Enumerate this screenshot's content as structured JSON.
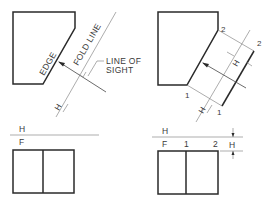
{
  "figure": {
    "panels": [
      {
        "id": "top-left",
        "description": "Top view with edge and fold line",
        "labels": {
          "edge": "EDGE",
          "fold_line": "FOLD LINE",
          "line_of_sight_1": "LINE OF",
          "line_of_sight_2": "SIGHT",
          "h": "H",
          "one": "1"
        }
      },
      {
        "id": "top-right",
        "description": "Top view with auxiliary projection",
        "labels": {
          "point_2_a": "2",
          "point_2_b": "2",
          "point_1_a": "1",
          "point_1_b": "1",
          "h": "H",
          "h_lower": "H"
        }
      },
      {
        "id": "bottom-left",
        "description": "Front view",
        "labels": {
          "h": "H",
          "f": "F"
        }
      },
      {
        "id": "bottom-right",
        "description": "Front view with reference points",
        "labels": {
          "h": "H",
          "f": "F",
          "one": "1",
          "two": "2",
          "h_dim": "H"
        }
      }
    ],
    "colors": {
      "object_line": "#2a2a2a",
      "construction_line": "#8a8a8a",
      "text": "#3a3a3a",
      "background": "#ffffff"
    }
  }
}
